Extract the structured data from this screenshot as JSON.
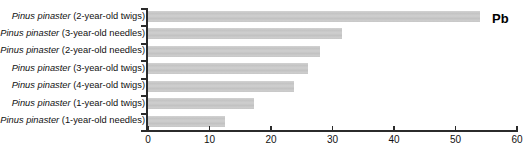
{
  "chart_data": {
    "type": "bar",
    "orientation": "horizontal",
    "title": "",
    "annotation": "Pb",
    "xlabel": "",
    "ylabel": "",
    "xlim": [
      0,
      60
    ],
    "xticks": [
      0,
      10,
      20,
      30,
      40,
      50,
      60
    ],
    "grid": false,
    "legend": null,
    "bar_color": "#c9c9c9",
    "axis_color": "#2b2b2b",
    "categories": [
      "Pinus pinaster (2-year-old twigs)",
      "Pinus pinaster (3-year-old needles)",
      "Pinus pinaster (2-year-old needles)",
      "Pinus pinaster (3-year-old twigs)",
      "Pinus pinaster (4-year-old twigs)",
      "Pinus pinaster (1-year-old twigs)",
      "Pinus pinaster (1-year-old needles)"
    ],
    "category_parts": [
      {
        "species": "Pinus pinaster",
        "qualifier": " (2-year-old twigs)"
      },
      {
        "species": "Pinus pinaster",
        "qualifier": " (3-year-old needles)"
      },
      {
        "species": "Pinus pinaster",
        "qualifier": " (2-year-old needles)"
      },
      {
        "species": "Pinus pinaster",
        "qualifier": " (3-year-old twigs)"
      },
      {
        "species": "Pinus pinaster",
        "qualifier": " (4-year-old twigs)"
      },
      {
        "species": "Pinus pinaster",
        "qualifier": " (1-year-old twigs)"
      },
      {
        "species": "Pinus pinaster",
        "qualifier": " (1-year-old needles)"
      }
    ],
    "values": [
      54.0,
      31.5,
      28.0,
      26.0,
      23.7,
      17.2,
      12.6
    ]
  }
}
